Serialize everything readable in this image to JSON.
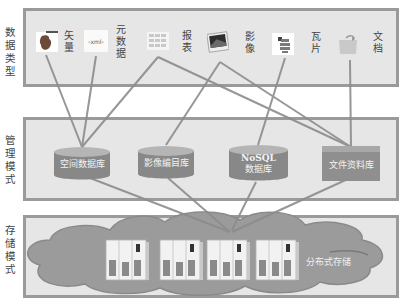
{
  "layers": [
    {
      "id": "data-types",
      "label": [
        "数",
        "据",
        "类",
        "型"
      ]
    },
    {
      "id": "management",
      "label": [
        "管",
        "理",
        "模",
        "式"
      ]
    },
    {
      "id": "storage",
      "label": [
        "存",
        "储",
        "模",
        "式"
      ]
    }
  ],
  "data_types": [
    {
      "name": "vector",
      "label": [
        "矢",
        "量"
      ],
      "icon": "vector-icon"
    },
    {
      "name": "metadata",
      "label": [
        "元",
        "数",
        "据"
      ],
      "icon": "xml-icon",
      "icon_text": "‹xml›"
    },
    {
      "name": "report",
      "label": [
        "报",
        "表"
      ],
      "icon": "table-icon"
    },
    {
      "name": "imagery",
      "label": [
        "影",
        "像"
      ],
      "icon": "photo-icon"
    },
    {
      "name": "tiles",
      "label": [
        "瓦",
        "片"
      ],
      "icon": "tiles-icon"
    },
    {
      "name": "document",
      "label": [
        "文",
        "档"
      ],
      "icon": "folder-icon"
    }
  ],
  "databases": [
    {
      "name": "spatial-db",
      "label": "空间数据库",
      "shape": "cylinder"
    },
    {
      "name": "image-catalog-db",
      "label": "影像编目库",
      "shape": "cylinder"
    },
    {
      "name": "nosql-db",
      "label_line1": "NoSQL",
      "label_line2": "数据库",
      "shape": "cylinder"
    },
    {
      "name": "file-db",
      "label": "文件资料库",
      "shape": "box"
    }
  ],
  "storage": {
    "label": "分布式存储",
    "server_count": 4
  },
  "colors": {
    "panel_bg": "#e6e6e6",
    "panel_border": "#9a9a9a",
    "line": "#8c8c8c",
    "db": "#8a8a8a",
    "cloud": "#9b9b9b"
  }
}
